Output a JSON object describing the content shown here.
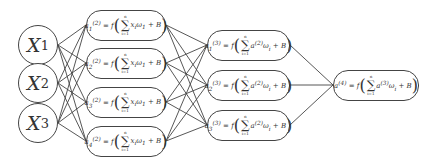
{
  "inputs": [
    {
      "label": "X",
      "sub": "1"
    },
    {
      "label": "X",
      "sub": "2"
    },
    {
      "label": "X",
      "sub": "3"
    }
  ],
  "hidden1": [
    {
      "lhs": "a",
      "sub": "1",
      "sup": "(2)",
      "eq": "= f",
      "term": "x",
      "term_sub": "i",
      "w": "ω",
      "w_sub": "1",
      "bias": "+ B",
      "top": "n",
      "bottom": "i=1"
    },
    {
      "lhs": "a",
      "sub": "2",
      "sup": "(2)",
      "eq": "= f",
      "term": "x",
      "term_sub": "i",
      "w": "ω",
      "w_sub": "1",
      "bias": "+ B",
      "top": "n",
      "bottom": "i=1"
    },
    {
      "lhs": "a",
      "sub": "3",
      "sup": "(2)",
      "eq": "= f",
      "term": "x",
      "term_sub": "i",
      "w": "ω",
      "w_sub": "1",
      "bias": "+ B",
      "top": "n",
      "bottom": "i=1"
    },
    {
      "lhs": "a",
      "sub": "4",
      "sup": "(2)",
      "eq": "= f",
      "term": "x",
      "term_sub": "i",
      "w": "ω",
      "w_sub": "1",
      "bias": "+ B",
      "top": "n",
      "bottom": "i=1"
    }
  ],
  "hidden2": [
    {
      "lhs": "a",
      "sub": "1",
      "sup": "(3)",
      "eq": "= f",
      "term": "a",
      "term_sub": "",
      "term_sup": "(2)",
      "w": "ω",
      "w_sub": "i",
      "bias": "+ B",
      "top": "n",
      "bottom": "i=1"
    },
    {
      "lhs": "a",
      "sub": "2",
      "sup": "(3)",
      "eq": "= f",
      "term": "a",
      "term_sub": "",
      "term_sup": "(2)",
      "w": "ω",
      "w_sub": "i",
      "bias": "+ B",
      "top": "n",
      "bottom": "i=1"
    },
    {
      "lhs": "a",
      "sub": "3",
      "sup": "(3)",
      "eq": "= f",
      "term": "a",
      "term_sub": "",
      "term_sup": "(2)",
      "w": "ω",
      "w_sub": "i",
      "bias": "+ B",
      "top": "n",
      "bottom": "i=1"
    }
  ],
  "output": {
    "lhs": "a",
    "sup": "(4)",
    "eq": "= f",
    "term": "a",
    "term_sup": "(3)",
    "w": "ω",
    "w_sub": "i",
    "bias": "+ B",
    "top": "n",
    "bottom": "i=1"
  },
  "sigma": "∑",
  "open_paren": "(",
  "close_paren": ")"
}
